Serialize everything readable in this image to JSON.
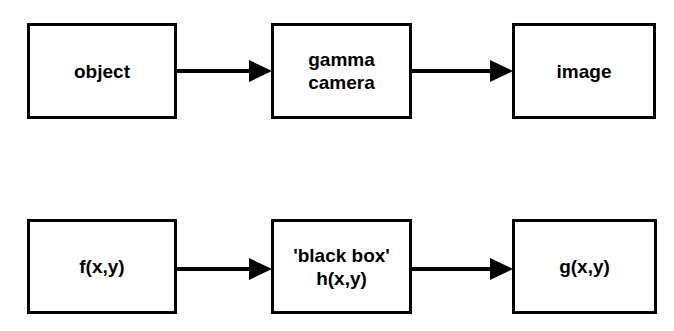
{
  "diagram": {
    "type": "flow-diagram",
    "background_color": "#ffffff",
    "stroke_color": "#000000",
    "rows": [
      {
        "id": "conceptual-row",
        "nodes": [
          {
            "id": "object",
            "label": "object"
          },
          {
            "id": "gamma-camera",
            "label": "gamma\ncamera"
          },
          {
            "id": "image",
            "label": "image"
          }
        ],
        "arrows": [
          {
            "id": "object-to-gamma",
            "from": "object",
            "to": "gamma-camera",
            "direction": "right"
          },
          {
            "id": "gamma-to-image",
            "from": "gamma-camera",
            "to": "image",
            "direction": "right"
          }
        ]
      },
      {
        "id": "mathematical-row",
        "nodes": [
          {
            "id": "f",
            "label": "f(x,y)"
          },
          {
            "id": "h",
            "label": "'black box'\nh(x,y)"
          },
          {
            "id": "g",
            "label": "g(x,y)"
          }
        ],
        "arrows": [
          {
            "id": "f-to-h",
            "from": "f",
            "to": "h",
            "direction": "right"
          },
          {
            "id": "h-to-g",
            "from": "h",
            "to": "g",
            "direction": "right"
          }
        ]
      }
    ]
  }
}
